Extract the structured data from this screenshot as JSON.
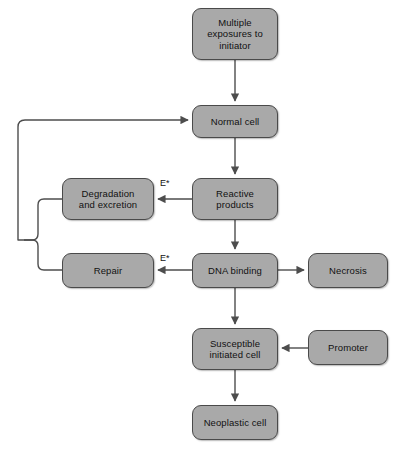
{
  "diagram": {
    "colors": {
      "node_fill": "#a9a9a9",
      "node_border": "#4a4a4a",
      "line": "#4d4d4d",
      "text": "#111111",
      "background": "#ffffff"
    },
    "nodes": [
      {
        "id": "multiple-exposures",
        "label": "Multiple\nexposures to\ninitiator",
        "x": 192,
        "y": 8,
        "w": 86,
        "h": 52
      },
      {
        "id": "normal-cell",
        "label": "Normal cell",
        "x": 192,
        "y": 105,
        "w": 86,
        "h": 33
      },
      {
        "id": "reactive-products",
        "label": "Reactive\nproducts",
        "x": 192,
        "y": 178,
        "w": 86,
        "h": 42
      },
      {
        "id": "degradation",
        "label": "Degradation\nand excretion",
        "x": 62,
        "y": 178,
        "w": 92,
        "h": 42
      },
      {
        "id": "dna-binding",
        "label": "DNA binding",
        "x": 192,
        "y": 253,
        "w": 86,
        "h": 35
      },
      {
        "id": "repair",
        "label": "Repair",
        "x": 62,
        "y": 253,
        "w": 92,
        "h": 35
      },
      {
        "id": "necrosis",
        "label": "Necrosis",
        "x": 308,
        "y": 253,
        "w": 80,
        "h": 35
      },
      {
        "id": "susceptible-cell",
        "label": "Susceptible\ninitiated cell",
        "x": 192,
        "y": 328,
        "w": 86,
        "h": 42
      },
      {
        "id": "promoter",
        "label": "Promoter",
        "x": 308,
        "y": 330,
        "w": 80,
        "h": 35
      },
      {
        "id": "neoplastic-cell",
        "label": "Neoplastic cell",
        "x": 192,
        "y": 405,
        "w": 86,
        "h": 35
      }
    ],
    "edge_labels": [
      {
        "id": "enzyme-label-degradation",
        "text": "E*",
        "x": 160,
        "y": 178
      },
      {
        "id": "enzyme-label-repair",
        "text": "E*",
        "x": 160,
        "y": 253
      }
    ]
  }
}
